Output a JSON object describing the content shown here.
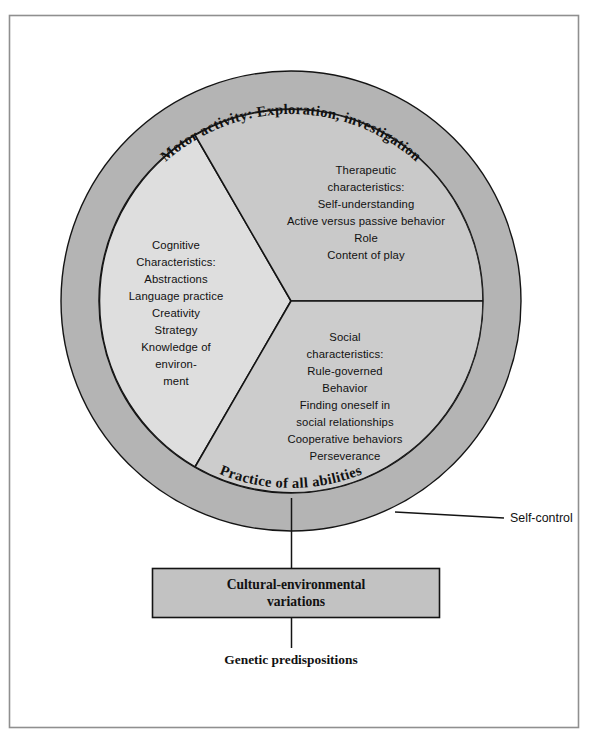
{
  "figure": {
    "title_hidden": "",
    "frame": {
      "border_color": "#8c8c8c"
    },
    "colors": {
      "ring_fill": "#b4b4b4",
      "segment_light": "#dedede",
      "segment_mid": "#c9c9c9",
      "segment_mid_lower": "#cccccc",
      "box_fill": "#c2c2c2",
      "line": "#141414",
      "text": "#111111"
    },
    "ring": {
      "top_label": "Motor activity: Exploration, investigation",
      "bottom_label": "Practice of all abilities"
    },
    "segments": [
      {
        "id": "cognitive",
        "name": "cognitive-segment",
        "lines": [
          "Cognitive",
          "Characteristics:",
          "Abstractions",
          "Language practice",
          "Creativity",
          "Strategy",
          "Knowledge of",
          "environ-",
          "ment"
        ]
      },
      {
        "id": "therapeutic",
        "name": "therapeutic-segment",
        "lines": [
          "Therapeutic",
          "characteristics:",
          "Self-understanding",
          "Active versus passive behavior",
          "Role",
          "Content of play"
        ]
      },
      {
        "id": "social",
        "name": "social-segment",
        "lines": [
          "Social",
          "characteristics:",
          "Rule-governed",
          "Behavior",
          "Finding oneself in",
          "social relationships",
          "Cooperative behaviors",
          "Perseverance"
        ]
      }
    ],
    "callout": {
      "label": "Self-control"
    },
    "box": {
      "line1": "Cultural-environmental",
      "line2": "variations"
    },
    "footer": {
      "label": "Genetic predispositions"
    }
  }
}
